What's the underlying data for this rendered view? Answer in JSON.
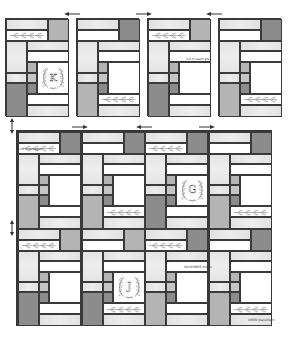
{
  "diagram": {
    "blocks_row": [
      {
        "id": "block-1",
        "x": 5,
        "y": 18,
        "w": 63,
        "h": 98,
        "variant": "K"
      },
      {
        "id": "block-2",
        "x": 76,
        "y": 18,
        "w": 63,
        "h": 98,
        "variant": "plain-wheat-bottom"
      },
      {
        "id": "block-3",
        "x": 147,
        "y": 18,
        "w": 63,
        "h": 98,
        "variant": "plain-wheat-top"
      },
      {
        "id": "block-4",
        "x": 218,
        "y": 18,
        "w": 63,
        "h": 98,
        "variant": "plain-wheat-bottom-dark"
      }
    ],
    "quilt": {
      "x": 17,
      "y": 131,
      "w": 254,
      "h": 194,
      "cols": 4,
      "rows": 2
    },
    "monograms": [
      "K",
      "G",
      "J"
    ],
    "labels": {
      "block3_label": "1/2 in seam grey",
      "quilt_label_top_left": "1/2 in selvages",
      "quilt_label_mid": "NOVEMBER motifs",
      "quilt_label_bottom_right": "WREN placement"
    },
    "arrows": {
      "top": [
        "left",
        "right",
        "left"
      ],
      "quilt_top": [
        "right",
        "left",
        "right"
      ],
      "side": [
        "up-down",
        "up-down"
      ]
    },
    "colors": {
      "outline": "#3a3a3a",
      "white": "#ffffff",
      "light": "#e6e6e6",
      "mid": "#b4b4b4",
      "dark": "#8c8c8c"
    }
  }
}
